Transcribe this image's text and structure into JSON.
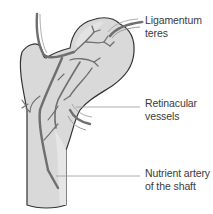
{
  "diagram": {
    "colors": {
      "bone_fill": "#d9d9d9",
      "bone_outline": "#333333",
      "vessel": "#6f6f6f",
      "vessel_light": "#9a9a9a",
      "leader_line": "#9a9a9a",
      "text": "#3a3a3a"
    },
    "labels": [
      {
        "id": "ligamentum-teres",
        "lines": [
          "Ligamentum",
          "teres"
        ]
      },
      {
        "id": "retinacular-vessels",
        "lines": [
          "Retinacular",
          "vessels"
        ]
      },
      {
        "id": "nutrient-artery",
        "lines": [
          "Nutrient artery",
          "of the shaft"
        ]
      }
    ]
  }
}
